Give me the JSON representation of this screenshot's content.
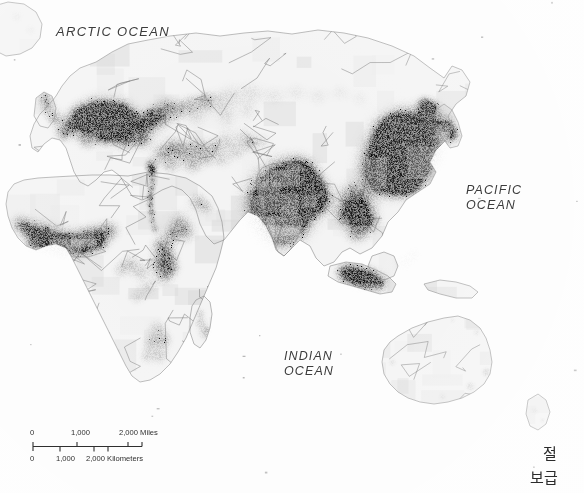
{
  "map": {
    "type": "world-population-density-map",
    "title_visible": false,
    "projection_note": "Eastern hemisphere: Europe, Africa, Asia, Australia",
    "background_color": "#fdfdfd",
    "land_color": "#f4f4f4",
    "border_color": "#8a8a8a",
    "density_color_low": "#d8d8d8",
    "density_color_mid": "#9a9a9a",
    "density_color_high": "#303030",
    "density_color_max": "#0d0d0d",
    "ocean_labels": [
      {
        "id": "arctic",
        "text": "ARCTIC OCEAN",
        "lines": [
          "ARCTIC OCEAN"
        ]
      },
      {
        "id": "pacific",
        "text": "PACIFIC OCEAN",
        "lines": [
          "PACIFIC",
          "OCEAN"
        ]
      },
      {
        "id": "indian",
        "text": "INDIAN OCEAN",
        "lines": [
          "INDIAN",
          "OCEAN"
        ]
      }
    ]
  },
  "scale_bar": {
    "name": "scale-bar",
    "miles": {
      "unit": "Miles",
      "ticks": [
        "0",
        "1,000",
        "2,000"
      ],
      "tick_0": "0",
      "tick_1": "1,000",
      "tick_2": "2,000 Miles"
    },
    "kilometers": {
      "unit": "Kilometers",
      "ticks": [
        "0",
        "1,000",
        "2,000"
      ],
      "tick_0": "0",
      "tick_1": "1,000",
      "tick_2": "2,000 Kilometers"
    }
  },
  "annotations": {
    "korean": {
      "line1": "절",
      "line2": "보급"
    }
  }
}
